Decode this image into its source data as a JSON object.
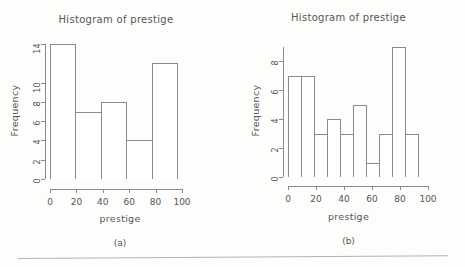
{
  "figure": {
    "background_color": "#fdfdfb",
    "line_color": "#8b8b8b",
    "text_color": "#555555",
    "bottom_rule": "horizontal-rule"
  },
  "panels": [
    {
      "caption": "(a)",
      "title": "Histogram of prestige",
      "xlabel": "prestige",
      "ylabel": "Frequency",
      "yticks": [
        "0",
        "2",
        "4",
        "6",
        "8",
        "10",
        "14"
      ],
      "xticks": [
        "0",
        "20",
        "40",
        "60",
        "80",
        "100"
      ]
    },
    {
      "caption": "(b)",
      "title": "Histogram of prestige",
      "xlabel": "prestige",
      "ylabel": "Frequency",
      "yticks": [
        "0",
        "2",
        "4",
        "6",
        "8"
      ],
      "xticks": [
        "0",
        "20",
        "40",
        "60",
        "80",
        "100"
      ]
    }
  ],
  "chart_data": [
    {
      "type": "bar",
      "title": "Histogram of prestige",
      "subtitle": "(a)",
      "xlabel": "prestige",
      "ylabel": "Frequency",
      "bin_width": 20,
      "bin_edges": [
        0,
        20,
        40,
        60,
        80,
        100
      ],
      "categories": [
        "0-20",
        "20-40",
        "40-60",
        "60-80",
        "80-100"
      ],
      "values": [
        14,
        7,
        8,
        4,
        12
      ],
      "xlim": [
        0,
        100
      ],
      "ylim": [
        0,
        14
      ],
      "ytick_values": [
        0,
        2,
        4,
        6,
        8,
        10,
        14
      ],
      "xtick_values": [
        0,
        20,
        40,
        60,
        80,
        100
      ],
      "grid": false,
      "legend": false
    },
    {
      "type": "bar",
      "title": "Histogram of prestige",
      "subtitle": "(b)",
      "xlabel": "prestige",
      "ylabel": "Frequency",
      "bin_width": 10,
      "bin_edges": [
        0,
        10,
        20,
        30,
        40,
        50,
        60,
        70,
        80,
        90,
        100
      ],
      "categories": [
        "0-10",
        "10-20",
        "20-30",
        "30-40",
        "40-50",
        "50-60",
        "60-70",
        "70-80",
        "80-90",
        "90-100"
      ],
      "values": [
        7,
        7,
        3,
        4,
        3,
        5,
        1,
        3,
        9,
        3
      ],
      "xlim": [
        0,
        100
      ],
      "ylim": [
        0,
        9
      ],
      "ytick_values": [
        0,
        2,
        4,
        6,
        8
      ],
      "xtick_values": [
        0,
        20,
        40,
        60,
        80,
        100
      ],
      "grid": false,
      "legend": false
    }
  ]
}
